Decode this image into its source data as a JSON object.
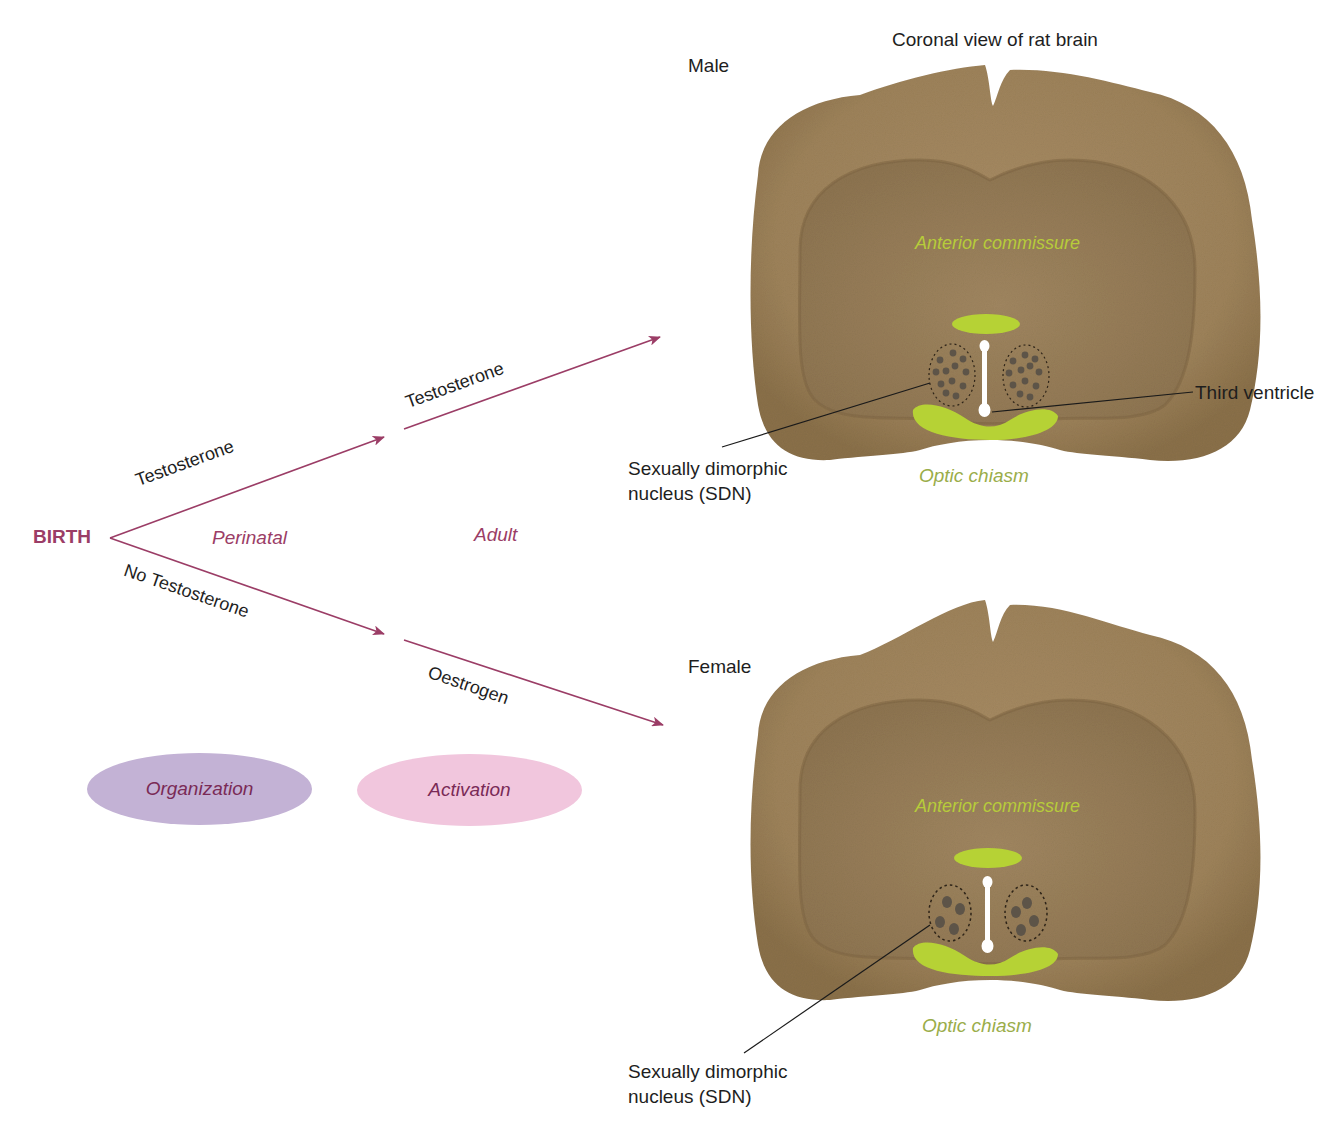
{
  "title": "Coronal view of rat brain",
  "timeline": {
    "start": "BIRTH",
    "period_perinatal": "Perinatal",
    "period_adult": "Adult",
    "upper_branch_label": "Testosterone",
    "upper_second_label": "Testosterone",
    "lower_branch_label": "No Testosterone",
    "lower_second_label": "Oestrogen"
  },
  "phases": [
    {
      "label": "Organization",
      "color": "#c2b0d4"
    },
    {
      "label": "Activation",
      "color": "#f2c4dc"
    }
  ],
  "male": {
    "label": "Male",
    "anterior_commissure": "Anterior commissure",
    "optic_chiasm": "Optic chiasm",
    "third_ventricle": "Third ventricle",
    "sdn_line1": "Sexually dimorphic",
    "sdn_line2": "nucleus (SDN)"
  },
  "female": {
    "label": "Female",
    "anterior_commissure": "Anterior commissure",
    "optic_chiasm": "Optic chiasm",
    "sdn_line1": "Sexually dimorphic",
    "sdn_line2": "nucleus (SDN)"
  },
  "colors": {
    "arrow": "#9b3d66",
    "brain": "#a58a62",
    "structure": "#b6d235"
  }
}
